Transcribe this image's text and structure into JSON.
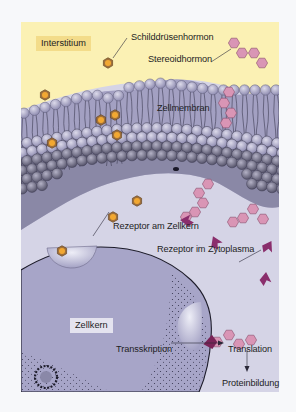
{
  "figure": {
    "regions": {
      "interstitium": "Interstitium",
      "cell_membrane": "Zellmembran",
      "nucleus": "Zellkern"
    },
    "hormones": {
      "thyroid": "Schilddrüsenhormon",
      "steroid": "Stereoidhormon"
    },
    "receptors": {
      "nuclear": "Rezeptor am Zellkern",
      "cytoplasmic": "Rezeptor im Zytoplasma"
    },
    "process": {
      "transcription": "Transskription",
      "translation": "Translation",
      "protein_synthesis": "Proteinbildung"
    },
    "colors": {
      "interstitium_bg": "#fbf1b4",
      "interstitium_label_bg": "#f3dc8a",
      "membrane": "#9f9cbf",
      "membrane_dark": "#6f6c8c",
      "cytoplasm": "#d5d4e6",
      "nucleus": "#a7a5c8",
      "thyroid_hormone_outer": "#a0703a",
      "thyroid_hormone_inner": "#f2a832",
      "steroid_hormone": "#d995b5",
      "receptor": "#8a2e6c"
    }
  }
}
